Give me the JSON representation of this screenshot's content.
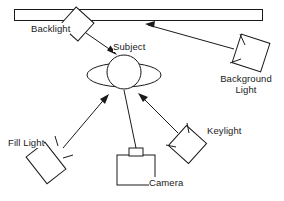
{
  "diagram": {
    "background_color": "#ffffff",
    "line_color": "#1a1a1a",
    "labels": {
      "backlight": "Backlight",
      "subject": "Subject",
      "background_light_line1": "Background",
      "background_light_line2": "Light",
      "keylight": "Keylight",
      "fill_light": "Fill Light",
      "camera": "Camera"
    },
    "elements": [
      {
        "name": "backdrop",
        "shape": "rectangle",
        "description": "Long thin horizontal backdrop panel at top of frame"
      },
      {
        "name": "backlight",
        "shape": "diamond",
        "description": "Rotated square light fixture aimed down-right at subject"
      },
      {
        "name": "subject",
        "shape": "circle-with-ellipse",
        "description": "Head circle with shoulders ellipse"
      },
      {
        "name": "background-light",
        "shape": "tilted-square-with-barndoors",
        "description": "Light at right aimed up-left toward backdrop"
      },
      {
        "name": "keylight",
        "shape": "tilted-square-with-barndoors",
        "description": "Light at lower right aimed up-left at subject"
      },
      {
        "name": "fill-light",
        "shape": "tilted-rectangle-with-barndoors",
        "description": "Light at lower left aimed up-right at subject"
      },
      {
        "name": "camera",
        "shape": "rectangle-with-lens",
        "description": "Camera body with lens facing up toward subject"
      }
    ],
    "rays": [
      {
        "name": "backlight-to-subject",
        "from": "backlight",
        "to": "subject",
        "arrow": true
      },
      {
        "name": "background-light-to-backdrop",
        "from": "background-light",
        "to": "backdrop",
        "arrow": true
      },
      {
        "name": "fill-light-to-subject",
        "from": "fill-light",
        "to": "subject",
        "arrow": true
      },
      {
        "name": "keylight-to-subject",
        "from": "keylight",
        "to": "subject",
        "arrow": true
      },
      {
        "name": "camera-to-subject",
        "from": "camera",
        "to": "subject",
        "arrow": false
      }
    ]
  }
}
